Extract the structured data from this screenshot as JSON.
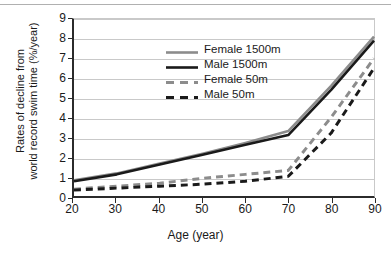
{
  "chart_data": {
    "type": "line",
    "title": "",
    "xlabel": "Age (year)",
    "ylabel": "Rates of decline from world record swim time (%/year)",
    "ylabel_line1": "Rates of decline from",
    "ylabel_line2": "world record swim time (%/year)",
    "xlim": [
      20,
      90
    ],
    "ylim": [
      0,
      9
    ],
    "xticks": [
      20,
      30,
      40,
      50,
      60,
      70,
      80,
      90
    ],
    "yticks": [
      0,
      1,
      2,
      3,
      4,
      5,
      6,
      7,
      8,
      9
    ],
    "grid": "horizontal",
    "legend_position": "upper-left-inside",
    "x": [
      20,
      30,
      40,
      50,
      60,
      70,
      80,
      90
    ],
    "series": [
      {
        "name": "Female 1500m",
        "values": [
          0.8,
          1.15,
          1.65,
          2.15,
          2.7,
          3.3,
          5.6,
          8.1
        ],
        "color": "#8c8c8c",
        "style": "solid",
        "width": 2.6
      },
      {
        "name": "Male 1500m",
        "values": [
          0.75,
          1.1,
          1.6,
          2.1,
          2.6,
          3.1,
          5.4,
          7.9
        ],
        "color": "#1a1a1a",
        "style": "solid",
        "width": 2.6
      },
      {
        "name": "Female 50m",
        "values": [
          0.35,
          0.5,
          0.65,
          0.9,
          1.1,
          1.3,
          4.0,
          7.0
        ],
        "color": "#8c8c8c",
        "style": "dashed",
        "width": 3.0
      },
      {
        "name": "Male 50m",
        "values": [
          0.3,
          0.4,
          0.5,
          0.6,
          0.75,
          1.0,
          3.2,
          6.5
        ],
        "color": "#1a1a1a",
        "style": "dashed",
        "width": 3.0
      }
    ],
    "legend": [
      {
        "label": "Female 1500m",
        "color": "#8c8c8c",
        "style": "solid"
      },
      {
        "label": "Male 1500m",
        "color": "#1a1a1a",
        "style": "solid"
      },
      {
        "label": "Female 50m",
        "color": "#8c8c8c",
        "style": "dashed"
      },
      {
        "label": "Male 50m",
        "color": "#1a1a1a",
        "style": "dashed"
      }
    ]
  }
}
